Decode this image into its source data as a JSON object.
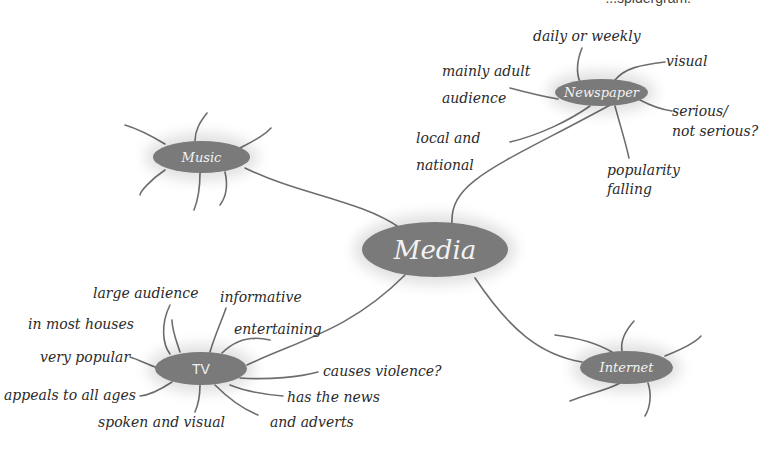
{
  "colors": {
    "node_fill": "#7a7a7a",
    "line": "#6e6e6e",
    "text": "#2a2a2a",
    "node_text": "#f2f2f2"
  },
  "top_clipped_text": "...spidergram.",
  "center": {
    "label": "Media"
  },
  "nodes": {
    "newspaper": {
      "label": "Newspaper",
      "branches": [
        "daily or weekly",
        "visual",
        "mainly adult",
        "audience",
        "serious/",
        "not serious?",
        "local and",
        "national",
        "popularity",
        "falling"
      ]
    },
    "music": {
      "label": "Music",
      "branches": []
    },
    "tv": {
      "label": "TV",
      "branches": [
        "large audience",
        "informative",
        "in most houses",
        "entertaining",
        "very popular",
        "causes violence?",
        "appeals to all ages",
        "has the news",
        "spoken and visual",
        "and adverts"
      ]
    },
    "internet": {
      "label": "Internet",
      "branches": []
    }
  }
}
